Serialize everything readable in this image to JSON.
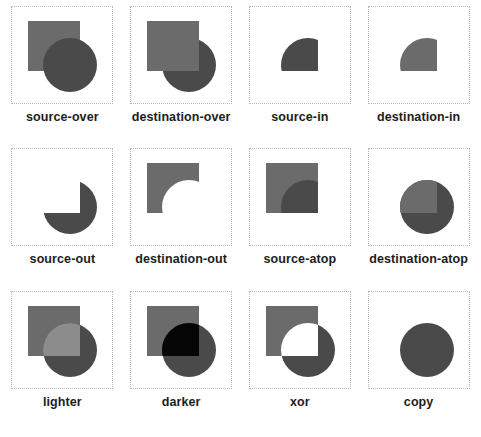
{
  "page": {
    "background_color": "#ffffff",
    "columns": 4,
    "rows": 3
  },
  "colors": {
    "square_color": "#6b6b6b",
    "circle_color": "#4a4a4a",
    "overlap_lighter": "#8c8c8c",
    "overlap_darker": "#050505",
    "cell_border": "#b9b9b9",
    "label_color": "#1d1d1d",
    "canvas_background": "#ffffff"
  },
  "shapes": {
    "square": {
      "x": 16,
      "y": 14,
      "width": 52,
      "height": 50
    },
    "circle": {
      "cx": 58,
      "cy": 58,
      "r": 27
    }
  },
  "cells": [
    {
      "id": "source-over",
      "label": "source-over",
      "mode": "source-over"
    },
    {
      "id": "destination-over",
      "label": "destination-over",
      "mode": "destination-over"
    },
    {
      "id": "source-in",
      "label": "source-in",
      "mode": "source-in"
    },
    {
      "id": "destination-in",
      "label": "destination-in",
      "mode": "destination-in"
    },
    {
      "id": "source-out",
      "label": "source-out",
      "mode": "source-out"
    },
    {
      "id": "destination-out",
      "label": "destination-out",
      "mode": "destination-out"
    },
    {
      "id": "source-atop",
      "label": "source-atop",
      "mode": "source-atop"
    },
    {
      "id": "destination-atop",
      "label": "destination-atop",
      "mode": "destination-atop"
    },
    {
      "id": "lighter",
      "label": "lighter",
      "mode": "lighter"
    },
    {
      "id": "darker",
      "label": "darker",
      "mode": "darker"
    },
    {
      "id": "xor",
      "label": "xor",
      "mode": "xor"
    },
    {
      "id": "copy",
      "label": "copy",
      "mode": "copy"
    }
  ]
}
